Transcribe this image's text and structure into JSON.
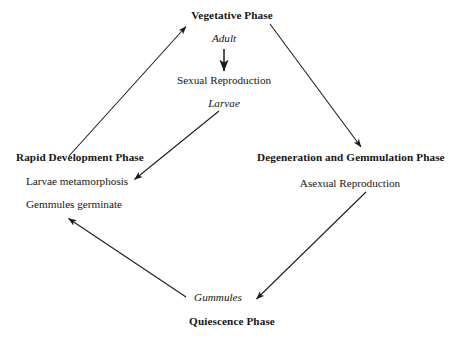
{
  "diagram": {
    "background_color": "#ffffff",
    "line_color": "#1a1a1a",
    "text_color": "#161616",
    "nodes": {
      "vegetative_phase": "Vegetative Phase",
      "adult": "Adult",
      "sexual_reproduction": "Sexual Reproduction",
      "larvae": "Larvae",
      "rapid_development_phase": "Rapid Development Phase",
      "larvae_metamorphosis": "Larvae metamorphosis",
      "gemmules_germinate": "Gemmules germinate",
      "degeneration_phase": "Degeneration and Gemmulation Phase",
      "asexual_reproduction": "Asexual Reproduction",
      "gummules": "Gummules",
      "quiescence_phase": "Quiescence Phase"
    },
    "edges": [
      {
        "name": "rapid-development-to-vegetative",
        "from": "Rapid Development Phase",
        "to": "Vegetative Phase"
      },
      {
        "name": "adult-to-sexual-reproduction",
        "from": "Adult",
        "to": "Sexual Reproduction"
      },
      {
        "name": "larvae-to-larvae-metamorphosis",
        "from": "Larvae",
        "to": "Larvae metamorphosis"
      },
      {
        "name": "vegetative-to-degeneration",
        "from": "Vegetative Phase",
        "to": "Degeneration and Gemmulation Phase"
      },
      {
        "name": "degeneration-to-gummules",
        "from": "Asexual Reproduction",
        "to": "Gummules"
      },
      {
        "name": "quiescence-to-rapid-development",
        "from": "Gummules",
        "to": "Gemmules germinate"
      }
    ]
  }
}
